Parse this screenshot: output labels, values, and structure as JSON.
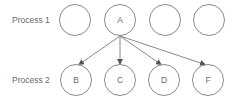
{
  "diagram": {
    "type": "process-dependency",
    "rows": [
      {
        "label": "Process 1",
        "nodes": [
          {
            "id": "p1n1",
            "label": "",
            "cx": 75,
            "cy": 20
          },
          {
            "id": "A",
            "label": "A",
            "cx": 120,
            "cy": 20
          },
          {
            "id": "p1n3",
            "label": "",
            "cx": 165,
            "cy": 20
          },
          {
            "id": "p1n4",
            "label": "",
            "cx": 209,
            "cy": 20
          }
        ]
      },
      {
        "label": "Process 2",
        "nodes": [
          {
            "id": "B",
            "label": "B",
            "cx": 76,
            "cy": 80
          },
          {
            "id": "C",
            "label": "C",
            "cx": 120,
            "cy": 80
          },
          {
            "id": "D",
            "label": "D",
            "cx": 164,
            "cy": 80
          },
          {
            "id": "F",
            "label": "F",
            "cx": 208,
            "cy": 80
          }
        ]
      }
    ],
    "edges": [
      {
        "from": "A",
        "to": "B"
      },
      {
        "from": "A",
        "to": "C"
      },
      {
        "from": "A",
        "to": "D"
      },
      {
        "from": "A",
        "to": "F"
      }
    ],
    "node_radius": 15.5,
    "colors": {
      "stroke": "#8a8a8a",
      "text": "#6a6a6a",
      "edge": "#7a7a7a"
    }
  }
}
